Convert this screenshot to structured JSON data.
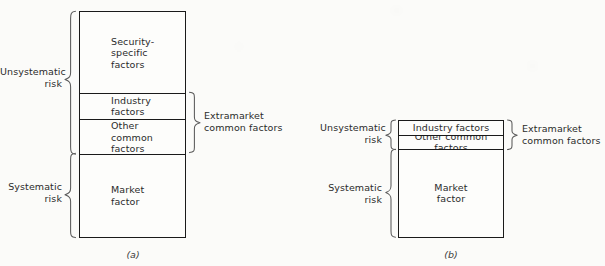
{
  "figure": {
    "background_color": "#fbfbf9",
    "line_color": "#1a1a1a",
    "brace_color": "#5a5a5a",
    "text_color": "#2b2b2b"
  },
  "panels": [
    {
      "id": "a",
      "caption": "(a)",
      "segments": [
        {
          "key": "security_specific",
          "label": "Security-\nspecific\nfactors",
          "align": "left"
        },
        {
          "key": "industry",
          "label": "Industry\nfactors",
          "align": "left"
        },
        {
          "key": "other_common",
          "label": "Other\ncommon\nfactors",
          "align": "left"
        },
        {
          "key": "market",
          "label": "Market\nfactor",
          "align": "left"
        }
      ],
      "left_labels": [
        {
          "key": "unsystematic",
          "label": "Unsystematic\nrisk",
          "spans": [
            "security_specific",
            "industry",
            "other_common"
          ]
        },
        {
          "key": "systematic",
          "label": "Systematic\nrisk",
          "spans": [
            "market"
          ]
        }
      ],
      "right_labels": [
        {
          "key": "extramarket",
          "label": "Extramarket\ncommon factors",
          "spans": [
            "industry",
            "other_common"
          ]
        }
      ]
    },
    {
      "id": "b",
      "caption": "(b)",
      "segments": [
        {
          "key": "industry",
          "label": "Industry factors",
          "align": "center"
        },
        {
          "key": "other_common",
          "label": "Other common factors",
          "align": "center"
        },
        {
          "key": "market",
          "label": "Market\nfactor",
          "align": "center"
        }
      ],
      "left_labels": [
        {
          "key": "unsystematic",
          "label": "Unsystematic\nrisk",
          "spans": [
            "industry",
            "other_common"
          ]
        },
        {
          "key": "systematic",
          "label": "Systematic\nrisk",
          "spans": [
            "market"
          ]
        }
      ],
      "right_labels": [
        {
          "key": "extramarket",
          "label": "Extramarket\ncommon factors",
          "spans": [
            "industry",
            "other_common"
          ]
        }
      ]
    }
  ]
}
